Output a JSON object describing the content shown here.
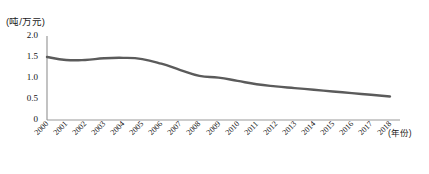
{
  "chart_data": {
    "type": "line",
    "title": "",
    "subtitle": "",
    "ylabel": "(吨/万元)",
    "xlabel": "(年份)",
    "grid": false,
    "legend": null,
    "ylim": [
      0,
      2.0
    ],
    "yticks": [
      "2.0",
      "1.5",
      "1.0",
      "0.5",
      "0"
    ],
    "ytick_values": [
      2.0,
      1.5,
      1.0,
      0.5,
      0
    ],
    "categories": [
      "2000",
      "2001",
      "2002",
      "2003",
      "2004",
      "2005",
      "2006",
      "2007",
      "2008",
      "2009",
      "2010",
      "2011",
      "2012",
      "2013",
      "2014",
      "2015",
      "2016",
      "2017",
      "2018"
    ],
    "x": [
      2000,
      2001,
      2002,
      2003,
      2004,
      2005,
      2006,
      2007,
      2008,
      2009,
      2010,
      2011,
      2012,
      2013,
      2014,
      2015,
      2016,
      2017,
      2018
    ],
    "values": [
      1.5,
      1.43,
      1.43,
      1.47,
      1.48,
      1.45,
      1.34,
      1.19,
      1.05,
      1.01,
      0.93,
      0.85,
      0.8,
      0.76,
      0.72,
      0.68,
      0.64,
      0.6,
      0.56
    ],
    "series": [
      {
        "name": "单位能耗",
        "values": [
          1.5,
          1.43,
          1.43,
          1.47,
          1.48,
          1.45,
          1.34,
          1.19,
          1.05,
          1.01,
          0.93,
          0.85,
          0.8,
          0.76,
          0.72,
          0.68,
          0.64,
          0.6,
          0.56
        ]
      }
    ],
    "line_color": "#5b5b5b",
    "axis_color": "#9a9a9a"
  }
}
